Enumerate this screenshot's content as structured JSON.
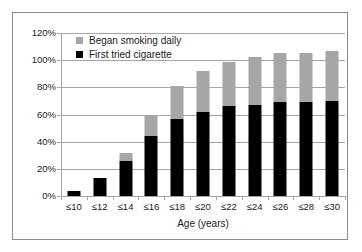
{
  "chart_data": {
    "type": "bar",
    "stacked": true,
    "title": "",
    "xlabel": "Age (years)",
    "ylabel": "",
    "categories": [
      "≤10",
      "≤12",
      "≤14",
      "≤16",
      "≤18",
      "≤20",
      "≤22",
      "≤24",
      "≤26",
      "≤28",
      "≤30"
    ],
    "series": [
      {
        "name": "First tried cigarette",
        "color": "#000000",
        "values": [
          4,
          13,
          26,
          44,
          57,
          62,
          66,
          67,
          69,
          69,
          70
        ]
      },
      {
        "name": "Began smoking daily",
        "color": "#a6a6a6",
        "values": [
          0,
          0,
          6,
          16,
          24,
          30,
          33,
          35,
          36,
          36,
          37
        ]
      }
    ],
    "cumulative_totals": [
      4,
      13,
      32,
      60,
      81,
      92,
      99,
      102,
      105,
      105,
      107
    ],
    "ylim": [
      0,
      120
    ],
    "yticks": [
      0,
      20,
      40,
      60,
      80,
      100,
      120
    ],
    "ytick_labels": [
      "0%",
      "20%",
      "40%",
      "60%",
      "80%",
      "100%",
      "120%"
    ],
    "grid": "horizontal",
    "legend_position": "top-left",
    "units": "percent"
  },
  "legend": {
    "items": [
      {
        "label": "Began smoking daily",
        "color": "#a6a6a6",
        "swatch": "gray-square-icon"
      },
      {
        "label": "First tried cigarette",
        "color": "#000000",
        "swatch": "black-square-icon"
      }
    ]
  },
  "axes": {
    "x_title": "Age (years)",
    "y_tick_labels": [
      "120%",
      "100%",
      "80%",
      "60%",
      "40%",
      "20%",
      "0%"
    ],
    "x_tick_labels": [
      "≤10",
      "≤12",
      "≤14",
      "≤16",
      "≤18",
      "≤20",
      "≤22",
      "≤24",
      "≤26",
      "≤28",
      "≤30"
    ]
  },
  "colors": {
    "bar_primary": "#000000",
    "bar_secondary": "#a6a6a6",
    "grid": "#a6a6a6",
    "frame": "#8c8c8c",
    "background": "#ffffff",
    "text": "#1a1a1a"
  }
}
